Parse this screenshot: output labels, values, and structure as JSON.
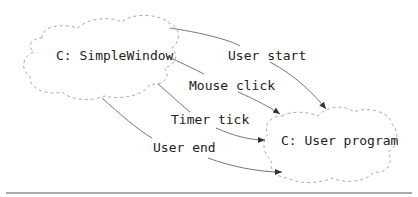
{
  "diagram": {
    "nodes": [
      {
        "id": "simplewindow",
        "label": "C: SimpleWindow"
      },
      {
        "id": "userprogram",
        "label": "C: User program"
      }
    ],
    "edges": [
      {
        "from": "simplewindow",
        "to": "userprogram",
        "label": "User start"
      },
      {
        "from": "simplewindow",
        "to": "userprogram",
        "label": "Mouse click"
      },
      {
        "from": "simplewindow",
        "to": "userprogram",
        "label": "Timer tick"
      },
      {
        "from": "simplewindow",
        "to": "userprogram",
        "label": "User end"
      }
    ]
  },
  "colors": {
    "cloud_stroke": "#aaaaaa",
    "edge_stroke": "#777777",
    "arrowhead": "#333333",
    "text": "#222222",
    "rule": "#555555"
  }
}
